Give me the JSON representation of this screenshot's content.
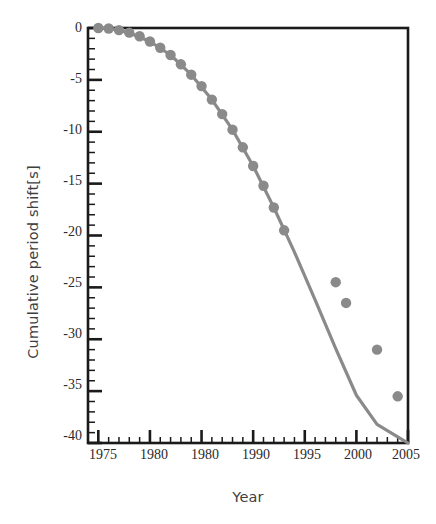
{
  "chart_data": {
    "type": "line",
    "title": "",
    "xlabel": "Year",
    "ylabel": "Cumulative period shift[s]",
    "xlim": [
      1974,
      2005
    ],
    "ylim": [
      -40,
      0
    ],
    "xticks": [
      1975,
      1980,
      1980,
      1990,
      1995,
      2000,
      2005
    ],
    "xtick_values": [
      1975,
      1980,
      1985,
      1990,
      1995,
      2000,
      2005
    ],
    "yticks": [
      0,
      -5,
      -10,
      -15,
      -20,
      -25,
      -30,
      -35,
      -40
    ],
    "x_minor_tick_interval": 1,
    "y_minor_tick_interval": 1,
    "grid": false,
    "legend": null,
    "marker": "circle",
    "marker_color": "#8a8a8a",
    "line_color": "#8a8a8a",
    "axis_color": "#1a1a1a",
    "series": [
      {
        "name": "Cumulative period shift",
        "x": [
          1975,
          1976,
          1977,
          1978,
          1979,
          1980,
          1981,
          1982,
          1983,
          1984,
          1985,
          1986,
          1987,
          1988,
          1989,
          1990,
          1991,
          1992,
          1993,
          1998,
          1999,
          2002,
          2004
        ],
        "values": [
          0.0,
          -0.05,
          -0.2,
          -0.45,
          -0.8,
          -1.3,
          -1.9,
          -2.6,
          -3.5,
          -4.5,
          -5.6,
          -6.9,
          -8.3,
          -9.8,
          -11.5,
          -13.3,
          -15.2,
          -17.3,
          -19.5,
          -24.5,
          -26.5,
          -31.0,
          -35.5
        ]
      }
    ],
    "curve_x": [
      1974.7,
      1976,
      1978,
      1980,
      1982,
      1984,
      1986,
      1988,
      1990,
      1992,
      1994,
      1996,
      1998,
      2000,
      2002,
      2004,
      2005
    ],
    "curve_y": [
      0.0,
      -0.05,
      -0.45,
      -1.3,
      -2.6,
      -4.5,
      -6.9,
      -9.8,
      -13.3,
      -17.3,
      -21.6,
      -26.2,
      -30.9,
      -35.4,
      -38.2,
      -39.4,
      -40.0
    ]
  },
  "axis": {
    "xtick_labels": [
      "1975",
      "1980",
      "1980",
      "1990",
      "1995",
      "2000",
      "2005"
    ],
    "ytick_labels": [
      "0",
      "-5",
      "-10",
      "-15",
      "-20",
      "-25",
      "-30",
      "-35",
      "-40"
    ],
    "x_title": "Year",
    "y_title": "Cumulative period shift[s]"
  }
}
